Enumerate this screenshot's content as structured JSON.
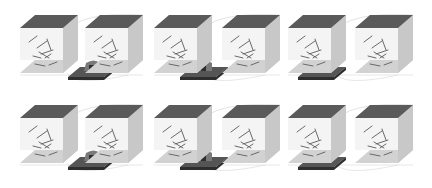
{
  "figure": {
    "rows": 2,
    "pairs_per_row": 3,
    "cubes_per_pair": 2,
    "colors": {
      "top_face": "#5a5a5a",
      "front_face": "#f4f4f4",
      "right_face": "#c8c8c8",
      "floor": "#d2d2d2",
      "rods": "#6a6a6a",
      "plate_top": "#555555",
      "plate_edge": "#2e2e2e",
      "bump": "#7a7a7a",
      "arcs": "#dcdcdc"
    }
  },
  "layout": {
    "row_top_y": [
      15,
      105
    ],
    "cube_front_x": [
      20,
      85,
      154,
      222,
      288,
      355
    ],
    "cube_width": 43,
    "cube_height": 45,
    "depth_dx": 15,
    "depth_dy": 13,
    "plate_center_x": [
      88,
      200,
      318
    ]
  }
}
